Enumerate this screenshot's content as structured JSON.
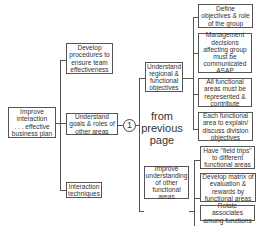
{
  "diagram": {
    "root": "Improve\ninteraction\n. . . effective\nbusiness plan",
    "level1": [
      "Develop\nprocedures to\nensure team\neffectiveness",
      "Understand\ngoals & roles of\nother areas",
      "Interaction\ntechniques"
    ],
    "connector": {
      "label": "1",
      "note": "from\nprevious\npage"
    },
    "level2": [
      "Understand\nregional &\nfunctional\nobjectives",
      "Improve\nunderstanding\nof other\nfunctional\nareas"
    ],
    "level3_regional": [
      "Define\nobjectives & role\nof the group",
      "Management\ndecisions\naffecting group\nmust be\ncommunicated\nASAP",
      "All functional\nareas must be\nrepresented &\ncontribute",
      "Each functional\narea to explain/\ndiscuss division\nobjectives"
    ],
    "level3_understanding": [
      "Have \"field trips\"\nto different\nfunctional areas",
      "Develop matrix of\nevaluation &\nrewards by\nfunctional areas",
      "Rotate associates\namong functions"
    ]
  }
}
